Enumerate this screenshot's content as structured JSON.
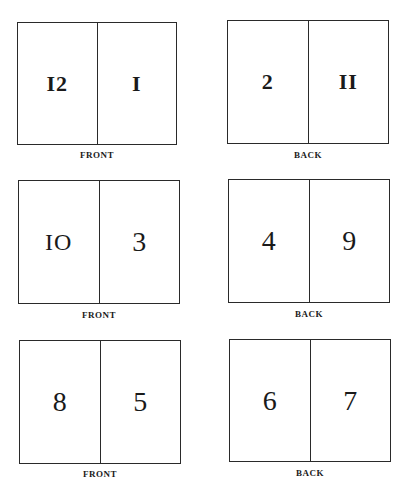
{
  "sheets": [
    {
      "side": "FRONT",
      "left_page": "I2",
      "right_page": "I"
    },
    {
      "side": "BACK",
      "left_page": "2",
      "right_page": "II"
    },
    {
      "side": "FRONT",
      "left_page": "IO",
      "right_page": "3"
    },
    {
      "side": "BACK",
      "left_page": "4",
      "right_page": "9"
    },
    {
      "side": "FRONT",
      "left_page": "8",
      "right_page": "5"
    },
    {
      "side": "BACK",
      "left_page": "6",
      "right_page": "7"
    }
  ]
}
